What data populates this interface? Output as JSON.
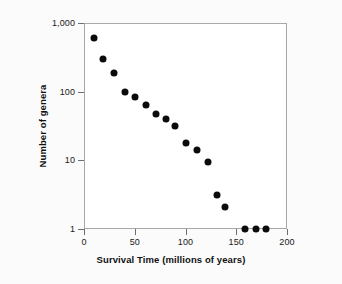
{
  "chart_data": {
    "type": "scatter",
    "title": "",
    "subtitle": "",
    "xlabel": "Survival Time (millions of years)",
    "ylabel": "Number of genera",
    "xlim": [
      0,
      200
    ],
    "ylim": [
      1,
      1000
    ],
    "yscale": "log",
    "xscale": "linear",
    "grid": false,
    "legend": null,
    "legend_position": "none",
    "x_ticks": [
      {
        "value": 0,
        "label": "0"
      },
      {
        "value": 50,
        "label": "50"
      },
      {
        "value": 100,
        "label": "100"
      },
      {
        "value": 150,
        "label": "150"
      },
      {
        "value": 200,
        "label": "200"
      }
    ],
    "y_ticks": [
      {
        "value": 1000,
        "label": "1,000"
      },
      {
        "value": 100,
        "label": "100"
      },
      {
        "value": 10,
        "label": "10"
      },
      {
        "value": 1,
        "label": "1"
      }
    ],
    "marker": {
      "shape": "circle",
      "color": "#0b0b0b",
      "size_px": 7
    },
    "series": [
      {
        "name": "genera",
        "x": [
          10,
          19,
          30,
          40,
          50,
          61,
          71,
          81,
          90,
          100,
          111,
          122,
          131,
          139,
          159,
          169,
          179
        ],
        "y": [
          600,
          300,
          190,
          100,
          85,
          63,
          48,
          40,
          32,
          18,
          14,
          9.3,
          3.1,
          2.1,
          1,
          1,
          1
        ]
      }
    ],
    "points": [
      {
        "x": 10,
        "y": 600
      },
      {
        "x": 19,
        "y": 300
      },
      {
        "x": 30,
        "y": 190
      },
      {
        "x": 40,
        "y": 100
      },
      {
        "x": 50,
        "y": 85
      },
      {
        "x": 61,
        "y": 63
      },
      {
        "x": 71,
        "y": 48
      },
      {
        "x": 81,
        "y": 40
      },
      {
        "x": 90,
        "y": 32
      },
      {
        "x": 100,
        "y": 18
      },
      {
        "x": 111,
        "y": 14
      },
      {
        "x": 122,
        "y": 9.3
      },
      {
        "x": 131,
        "y": 3.1
      },
      {
        "x": 139,
        "y": 2.1
      },
      {
        "x": 159,
        "y": 1
      },
      {
        "x": 169,
        "y": 1
      },
      {
        "x": 179,
        "y": 1
      }
    ]
  },
  "colors": {
    "background": "#fbfbfb",
    "plot_background": "#ffffff",
    "frame": "#a8a8ac",
    "marker": "#0b0b0b",
    "text": "#111111",
    "tick": "#6d6d72"
  }
}
